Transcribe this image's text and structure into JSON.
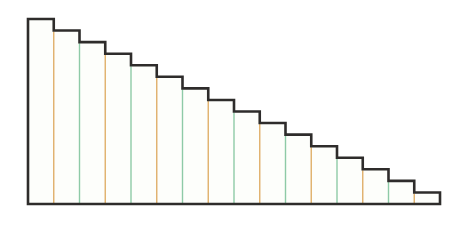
{
  "chart_data": {
    "type": "bar",
    "title": "",
    "subtitle": "",
    "xlabel": "",
    "ylabel": "",
    "grid": false,
    "legend": "none",
    "annotations": [],
    "categories": [
      "1",
      "2",
      "3",
      "4",
      "5",
      "6",
      "7",
      "8",
      "9",
      "10",
      "11",
      "12",
      "13",
      "14",
      "15",
      "16"
    ],
    "tick_labels": [],
    "values": [
      16,
      15,
      14,
      13,
      12,
      11,
      10,
      9,
      8,
      7,
      6,
      5,
      4,
      3,
      2,
      1
    ],
    "ylim": [
      0,
      16
    ],
    "xlim": [
      0,
      16
    ],
    "series": [
      {
        "name": "steps",
        "values": [
          16,
          15,
          14,
          13,
          12,
          11,
          10,
          9,
          8,
          7,
          6,
          5,
          4,
          3,
          2,
          1
        ]
      }
    ]
  },
  "style": {
    "outline_color": "#2e2c2b",
    "outline_width": 2.6,
    "fill_color": "#fdfefb",
    "divider_orange": "#e0b06a",
    "divider_green": "#8ecaa7",
    "divider_width": 1.4,
    "background": "#ffffff"
  },
  "geometry": {
    "left": 28,
    "right": 440,
    "baseline": 204,
    "top": 19,
    "step_width": 25.75,
    "step_height": 11.56,
    "bar_count": 16
  },
  "divider_sequence": [
    "orange",
    "green",
    "orange",
    "green",
    "orange",
    "green",
    "orange",
    "green",
    "orange",
    "green",
    "orange",
    "green",
    "orange",
    "green",
    "orange"
  ]
}
